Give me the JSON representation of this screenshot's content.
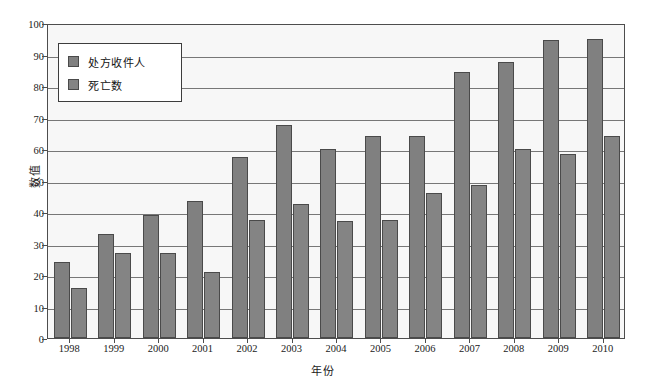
{
  "chart_data": {
    "type": "bar",
    "title": "",
    "xlabel": "年份",
    "ylabel": "数值",
    "ylim": [
      0,
      100
    ],
    "yticks": [
      0,
      10,
      20,
      30,
      40,
      50,
      60,
      70,
      80,
      90,
      100
    ],
    "grid": true,
    "legend_position": "top-left",
    "categories": [
      "1998",
      "1999",
      "2000",
      "2001",
      "2002",
      "2003",
      "2004",
      "2005",
      "2006",
      "2007",
      "2008",
      "2009",
      "2010"
    ],
    "series": [
      {
        "name": "处方收件人",
        "color": "#808080",
        "values": [
          24,
          33,
          39,
          43.5,
          57.5,
          67.5,
          60,
          64,
          64,
          84.5,
          87.5,
          94.5,
          95
        ]
      },
      {
        "name": "死亡数",
        "color": "#848484",
        "values": [
          16,
          27,
          27,
          21,
          37.5,
          42.5,
          37,
          37.5,
          46,
          48.5,
          60,
          58.5,
          64
        ]
      }
    ]
  },
  "colors": {
    "bar_fill": "#808080",
    "bar_stroke": "#4a4a4a",
    "plot_background": "#f7f7f7",
    "axis": "#4d4d4d",
    "gridline": "#777777",
    "text": "#1a1a1a"
  }
}
